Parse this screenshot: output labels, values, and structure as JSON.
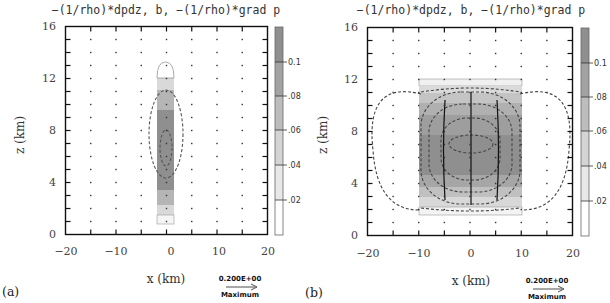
{
  "figure": {
    "panels": [
      {
        "label": "(a)",
        "title": "−(1/rho)*dpdz, b, −(1/rho)*grad p",
        "xlabel": "x (km)",
        "ylabel": "z (km)",
        "xticks": [
          "−20",
          "−10",
          "0",
          "10",
          "20"
        ],
        "yticks": [
          "0",
          "4",
          "8",
          "12",
          "16"
        ],
        "colorbar_labels": [
          "0.1",
          ".08",
          ".06",
          ".04",
          ".02"
        ],
        "contour_labels": [
          ".02",
          ".02"
        ],
        "reference_vector": {
          "value": "0.200E+00",
          "label": "Maximum"
        }
      },
      {
        "label": "(b)",
        "title": "−(1/rho)*dpdz, b, −(1/rho)*grad p",
        "xlabel": "x (km)",
        "ylabel": "z (km)",
        "xticks": [
          "−20",
          "−10",
          "0",
          "10",
          "20"
        ],
        "yticks": [
          "0",
          "4",
          "8",
          "12",
          "16"
        ],
        "colorbar_labels": [
          "0.1",
          ".08",
          ".06",
          ".04",
          ".02"
        ],
        "contour_labels": [
          ".02",
          ".02"
        ],
        "reference_vector": {
          "value": "0.200E+00",
          "label": "Maximum"
        }
      }
    ]
  },
  "chart_data": [
    {
      "type": "heatmap",
      "title": "−(1/rho)*dpdz, b, −(1/rho)*grad p",
      "panel": "(a)",
      "xlabel": "x (km)",
      "ylabel": "z (km)",
      "xlim": [
        -20,
        20
      ],
      "ylim": [
        0,
        16
      ],
      "xticks": [
        -20,
        -10,
        0,
        10,
        20
      ],
      "yticks": [
        0,
        4,
        8,
        12,
        16
      ],
      "shaded_field": "b (buoyancy)",
      "shaded_region": {
        "x": [
          -1.5,
          1.5
        ],
        "z": [
          2,
          13
        ],
        "max_near_z": 7
      },
      "colorbar": {
        "levels": [
          0.02,
          0.04,
          0.06,
          0.08,
          0.1
        ],
        "range": [
          0,
          0.12
        ]
      },
      "dashed_contours": "-(1/rho)*dpdz, closed ellipses centered near x=0, z=7",
      "vectors": "-(1/rho)*grad p, weak, mostly vertical near x=0",
      "reference_vector": "0.200E+00 Maximum",
      "grid": false
    },
    {
      "type": "heatmap",
      "title": "−(1/rho)*dpdz, b, −(1/rho)*grad p",
      "panel": "(b)",
      "xlabel": "x (km)",
      "ylabel": "z (km)",
      "xlim": [
        -20,
        20
      ],
      "ylim": [
        0,
        16
      ],
      "xticks": [
        -20,
        -10,
        0,
        10,
        20
      ],
      "yticks": [
        0,
        4,
        8,
        12,
        16
      ],
      "shaded_field": "b (buoyancy)",
      "shaded_region": {
        "x": [
          -10,
          10
        ],
        "z": [
          2,
          12
        ],
        "max_near_z": 7
      },
      "colorbar": {
        "levels": [
          0.02,
          0.04,
          0.06,
          0.08,
          0.1
        ],
        "range": [
          0,
          0.12
        ]
      },
      "dashed_contours": "-(1/rho)*dpdz, nested closed contours centered near x=0, z=7; outer lobes extending to x=±14",
      "vectors": "-(1/rho)*grad p, downward inside bubble, outward/horizontal above z=12",
      "reference_vector": "0.200E+00 Maximum",
      "grid": false
    }
  ]
}
